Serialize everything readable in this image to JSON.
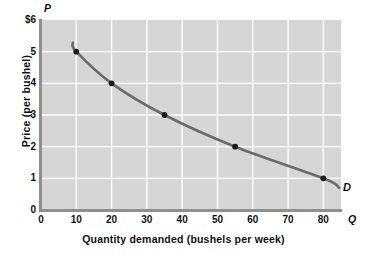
{
  "chart_data": {
    "type": "line",
    "title": "",
    "subtitle": "",
    "xlabel": "Quantity demanded (bushels per week)",
    "ylabel": "Price (per bushel)",
    "x_symbol": "Q",
    "y_symbol": "P",
    "xlim": [
      0,
      85
    ],
    "ylim": [
      0,
      6
    ],
    "xticks": [
      0,
      10,
      20,
      30,
      40,
      50,
      60,
      70,
      80
    ],
    "xtick_labels": [
      "0",
      "10",
      "20",
      "30",
      "40",
      "50",
      "60",
      "70",
      "80"
    ],
    "yticks": [
      0,
      1,
      2,
      3,
      4,
      5,
      6
    ],
    "ytick_labels": [
      "0",
      "1",
      "2",
      "3",
      "4",
      "5",
      "$6"
    ],
    "grid": true,
    "grid_color": "#ffffff",
    "plot_bgcolor": "#d6d6d6",
    "line_color": "#6b6b6b",
    "marker_color": "#1a1a1a",
    "legend_position": "none",
    "annotations": [
      {
        "text": "D",
        "x": 85,
        "y": 0.75,
        "style": "italic-bold"
      }
    ],
    "series": [
      {
        "name": "D",
        "label": "Demand",
        "points": [
          {
            "x": 10,
            "y": 5
          },
          {
            "x": 20,
            "y": 4
          },
          {
            "x": 35,
            "y": 3
          },
          {
            "x": 55,
            "y": 2
          },
          {
            "x": 80,
            "y": 1
          }
        ]
      }
    ]
  }
}
